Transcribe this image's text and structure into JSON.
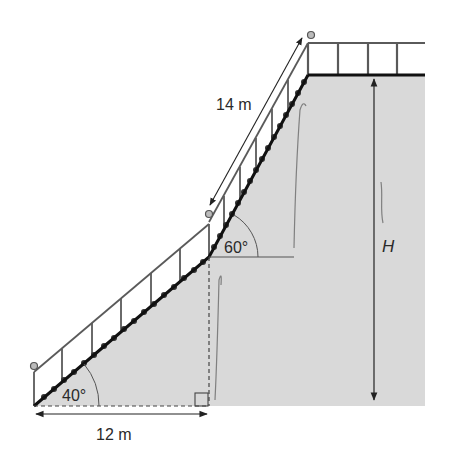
{
  "diagram": {
    "labels": {
      "lower_angle": "40°",
      "upper_angle": "60°",
      "horizontal_distance": "12 m",
      "upper_stair_length": "14 m",
      "height": "H"
    },
    "colors": {
      "ground_fill": "#d9d9d9",
      "stair_line": "#111111",
      "rail": "#555555",
      "annotation": "#333333",
      "pencil": "#6a6a6a"
    }
  }
}
